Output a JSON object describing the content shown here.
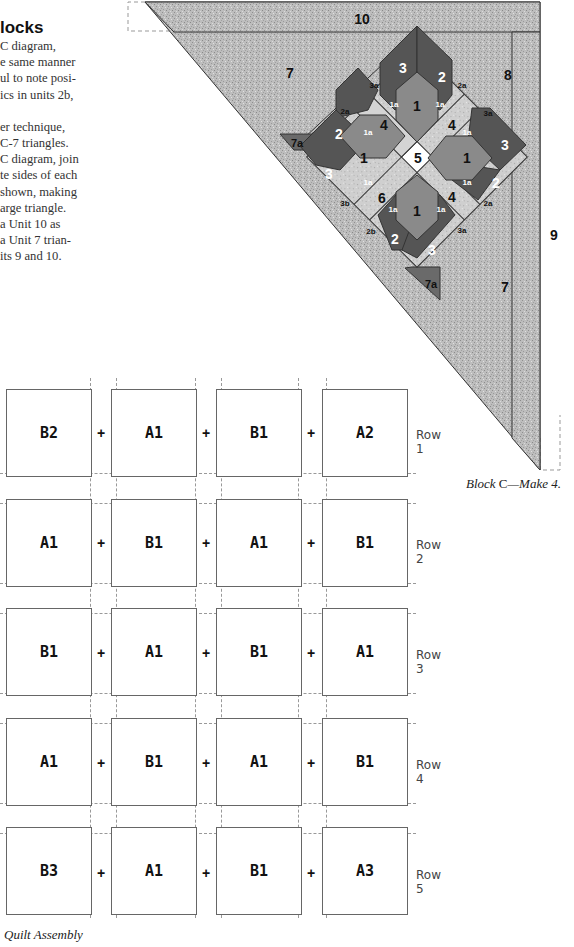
{
  "instructions": {
    "heading": "locks",
    "lines": [
      "C diagram,",
      "e same manner",
      "ul to note posi-",
      "ics in units 2b,",
      "",
      "er technique,",
      "C-7 triangles.",
      "C diagram, join",
      "te sides of each",
      " shown, making",
      "arge triangle.",
      "a Unit 10 as",
      "a Unit 7 trian-",
      "its 9 and 10."
    ]
  },
  "block_c_diagram": {
    "caption_prefix": "Block ",
    "caption_letter": "C",
    "caption_suffix": "—Make 4.",
    "colors": {
      "background_print": "#b8b8b8",
      "dark": "#555555",
      "medium": "#8a8a8a",
      "light": "#d2d2d2",
      "center": "#ffffff",
      "outline": "#333333"
    },
    "unit_labels": {
      "u10": "10",
      "u9": "9",
      "u8": "8",
      "u7_top": "7",
      "u7_bottom": "7",
      "u7a_left": "7a",
      "u7a_bottom": "7a",
      "u5": "5",
      "u6": "6",
      "u4_tl": "4",
      "u4_tr": "4",
      "u4_br": "4",
      "u1_top": "1",
      "u1_left": "1",
      "u1_right": "1",
      "u1_bottom": "1",
      "u2_top": "2",
      "u3_top": "3",
      "u2_left": "2",
      "u3_left": "3",
      "u3_right": "3",
      "u2_right": "2",
      "u2_bottom": "2",
      "u3_bottom": "3",
      "u1a": "1a",
      "u2a": "2a",
      "u3a": "3a",
      "u2b": "2b",
      "u3b": "3b"
    }
  },
  "quilt_assembly": {
    "caption": "Quilt Assembly",
    "plus": "+",
    "rows": [
      {
        "label": "Row 1",
        "blocks": [
          "B2",
          "A1",
          "B1",
          "A2"
        ]
      },
      {
        "label": "Row 2",
        "blocks": [
          "A1",
          "B1",
          "A1",
          "B1"
        ]
      },
      {
        "label": "Row 3",
        "blocks": [
          "B1",
          "A1",
          "B1",
          "A1"
        ]
      },
      {
        "label": "Row 4",
        "blocks": [
          "A1",
          "B1",
          "A1",
          "B1"
        ]
      },
      {
        "label": "Row 5",
        "blocks": [
          "B3",
          "A1",
          "B1",
          "A3"
        ]
      }
    ]
  }
}
